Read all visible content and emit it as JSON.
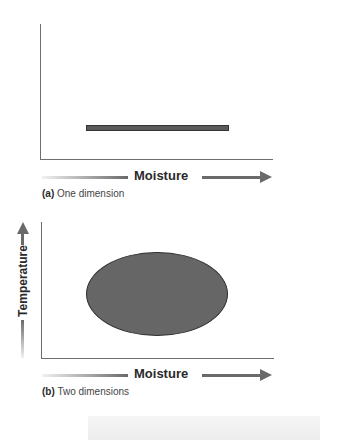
{
  "figure": {
    "panels": [
      {
        "id": "a",
        "caption_letter": "(a)",
        "caption_text": "One dimension",
        "x_axis_label": "Moisture",
        "shape": "horizontal bar (niche range along moisture)",
        "colors": {
          "shape_fill": "#5a5a5a",
          "axis": "#6a6a6a"
        }
      },
      {
        "id": "b",
        "caption_letter": "(b)",
        "caption_text": "Two dimensions",
        "x_axis_label": "Moisture",
        "y_axis_label": "Temperature",
        "shape": "ellipse (niche space across moisture and temperature)",
        "colors": {
          "shape_fill": "#666666",
          "axis": "#6a6a6a"
        }
      }
    ]
  }
}
